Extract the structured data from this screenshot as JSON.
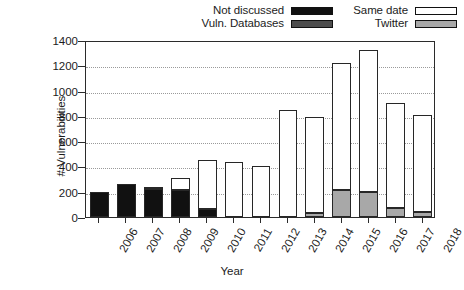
{
  "legend": {
    "entries": [
      {
        "label": "Not discussed",
        "key": "notdiscussed",
        "color": "#111111"
      },
      {
        "label": "Vuln. Databases",
        "key": "vulndb",
        "color": "#4d4d4d"
      },
      {
        "label": "Same date",
        "key": "samedate",
        "color": "#ffffff"
      },
      {
        "label": "Twitter",
        "key": "twitter",
        "color": "#a8a8a8"
      }
    ]
  },
  "axes": {
    "ylabel": "# Vulnerabilities",
    "xlabel": "Year",
    "yticks": [
      "0",
      "200",
      "400",
      "600",
      "800",
      "1000",
      "1200",
      "1400"
    ],
    "xticks": [
      "2006",
      "2007",
      "2008",
      "2009",
      "2010",
      "2011",
      "2012",
      "2013",
      "2014",
      "2015",
      "2016",
      "2017",
      "2018"
    ]
  },
  "chart_data": {
    "type": "bar",
    "title": "",
    "xlabel": "Year",
    "ylabel": "# Vulnerabilities",
    "ylim": [
      0,
      1400
    ],
    "ytick_step": 200,
    "grid": true,
    "stacked": true,
    "legend_position": "above-plot",
    "categories": [
      "2006",
      "2007",
      "2008",
      "2009",
      "2010",
      "2011",
      "2012",
      "2013",
      "2014",
      "2015",
      "2016",
      "2017",
      "2018"
    ],
    "series": [
      {
        "name": "Not discussed",
        "color": "#111111",
        "values": [
          195,
          265,
          225,
          215,
          60,
          0,
          0,
          0,
          0,
          0,
          0,
          0,
          0
        ]
      },
      {
        "name": "Vuln. Databases",
        "color": "#4d4d4d",
        "values": [
          0,
          0,
          0,
          0,
          0,
          0,
          0,
          0,
          0,
          0,
          0,
          0,
          0
        ]
      },
      {
        "name": "Twitter",
        "color": "#a8a8a8",
        "values": [
          0,
          0,
          0,
          0,
          0,
          0,
          0,
          0,
          30,
          210,
          200,
          70,
          40
        ]
      },
      {
        "name": "Same date",
        "color": "#ffffff",
        "values": [
          0,
          0,
          15,
          95,
          390,
          435,
          405,
          850,
          760,
          1010,
          1120,
          830,
          765
        ]
      }
    ],
    "totals": [
      195,
      265,
      240,
      310,
      450,
      435,
      405,
      850,
      790,
      1220,
      1320,
      900,
      805
    ]
  }
}
